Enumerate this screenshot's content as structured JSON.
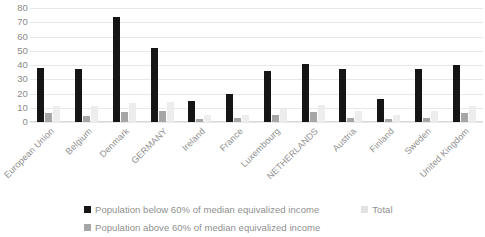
{
  "chart_data": {
    "type": "bar",
    "title": "",
    "xlabel": "",
    "ylabel": "",
    "ylim": [
      0,
      80
    ],
    "yticks": [
      80,
      70,
      60,
      50,
      40,
      30,
      20,
      10,
      0
    ],
    "grid": true,
    "legend_position": "bottom",
    "categories": [
      "European Union",
      "Belgium",
      "Denmark",
      "GERMANY",
      "Ireland",
      "France",
      "Luxembourg",
      "NETHERLANDS",
      "Austria",
      "Finland",
      "Sweden",
      "United Kingdom"
    ],
    "series": [
      {
        "name": "Population below 60% of median equivalized income",
        "color": "#151515",
        "values": [
          38,
          37,
          74,
          52,
          15,
          20,
          36,
          41,
          37,
          16,
          37,
          40
        ]
      },
      {
        "name": "Population above 60% of median equivalized income",
        "color": "#a6a6a6",
        "values": [
          6,
          4,
          7,
          8,
          2,
          3,
          5,
          7,
          3,
          2,
          3,
          6
        ]
      },
      {
        "name": "Total",
        "color": "#e2e2e2",
        "values": [
          11,
          11,
          13,
          14,
          5,
          5,
          9,
          12,
          8,
          5,
          8,
          11
        ]
      }
    ]
  },
  "legend": {
    "items": [
      {
        "label": "Population below 60% of median equivalized income",
        "swatch": "legend-swatch-dark"
      },
      {
        "label": "Total",
        "swatch": "legend-swatch-light"
      },
      {
        "label": "Population above 60% of median equivalized income",
        "swatch": "legend-swatch-gray"
      }
    ]
  }
}
